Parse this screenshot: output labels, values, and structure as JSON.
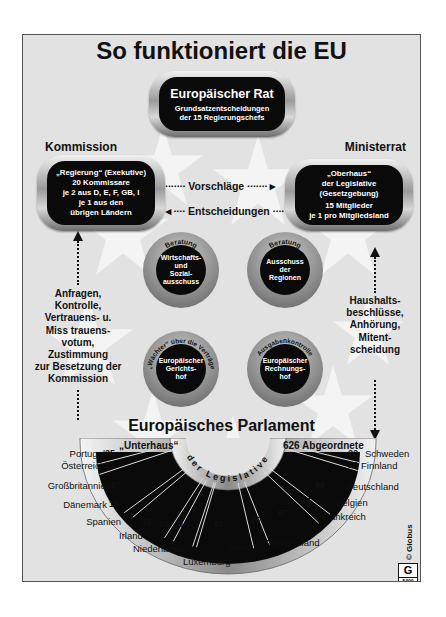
{
  "title": "So funktioniert die EU",
  "rat": {
    "name": "Europäischer Rat",
    "desc_line1": "Grundsatzentscheidungen",
    "desc_line2": "der 15 Regierungschefs"
  },
  "kommission": {
    "heading": "Kommission",
    "line1": "„Regierung“ (Exekutive)",
    "line2": "20 Kommissare",
    "line3": "je 2 aus D, E, F, GB, I",
    "line4": "je 1 aus den",
    "line5": "übrigen Ländern"
  },
  "ministerrat": {
    "heading": "Ministerrat",
    "line1": "„Oberhaus“",
    "line2": "der Legislative",
    "line3": "(Gesetzgebung)",
    "line4": "15 Mitglieder",
    "line5": "je 1 pro Mitgliedsland"
  },
  "arrows": {
    "vorschlaege": "Vorschläge",
    "entscheidungen": "Entscheidungen"
  },
  "bodies": [
    {
      "ring": "Beratung",
      "l1": "Wirtschafts-",
      "l2": "und",
      "l3": "Sozial-",
      "l4": "ausschuss"
    },
    {
      "ring": "Beratung",
      "l1": "Ausschuss",
      "l2": "der",
      "l3": "Regionen",
      "l4": ""
    },
    {
      "ring": "„Wächter“ über die Verträge",
      "l1": "Europäischer",
      "l2": "Gerichts-",
      "l3": "hof",
      "l4": ""
    },
    {
      "ring": "Ausgabenkontrolle",
      "l1": "Europäischer",
      "l2": "Rechnungs-",
      "l3": "hof",
      "l4": ""
    }
  ],
  "left_text": [
    "Anfragen,",
    "Kontrolle,",
    "Vertrauens- u.",
    "Miss trauens-",
    "votum,",
    "Zustimmung",
    "zur Besetzung der",
    "Kommission"
  ],
  "right_text": [
    "Haushalts-",
    "beschlüsse,",
    "Anhörung,",
    "Mitent-",
    "scheidung"
  ],
  "parlament": {
    "heading": "Europäisches Parlament",
    "unterhaus": "„Unterhaus“",
    "total": "626 Abgeordnete",
    "arc_text": "der Legislative"
  },
  "seats": [
    {
      "country": "Portugal",
      "seats": "25"
    },
    {
      "country": "Österreich",
      "seats": "21"
    },
    {
      "country": "Großbritannien",
      "seats": "87"
    },
    {
      "country": "Dänemark",
      "seats": "16"
    },
    {
      "country": "Spanien",
      "seats": "64"
    },
    {
      "country": "Irland",
      "seats": "15"
    },
    {
      "country": "Niederlande",
      "seats": "31"
    },
    {
      "country": "Luxemburg",
      "seats": "6"
    },
    {
      "country": "Italien",
      "seats": "87"
    },
    {
      "country": "Griechenland",
      "seats": "25"
    },
    {
      "country": "Frankreich",
      "seats": "87"
    },
    {
      "country": "Belgien",
      "seats": "25"
    },
    {
      "country": "Deutschland",
      "seats": "99"
    },
    {
      "country": "Finnland",
      "seats": "16"
    },
    {
      "country": "Schweden",
      "seats": "22"
    }
  ],
  "credit": "© Globus",
  "badge": "G",
  "badge_code": "5499"
}
